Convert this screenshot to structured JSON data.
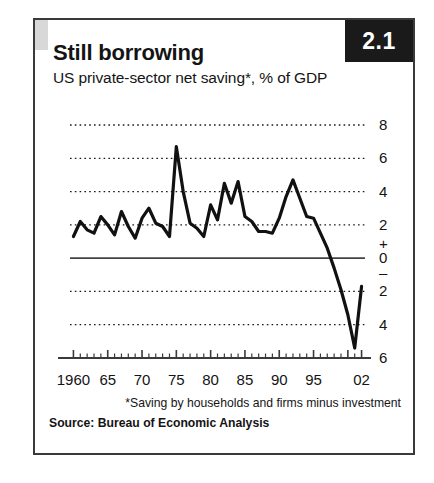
{
  "figure": {
    "badge_label": "2.1",
    "title": "Still borrowing",
    "subtitle": "US private-sector net saving*, % of GDP",
    "footnote": "*Saving by households and firms minus investment",
    "source": "Source: Bureau of Economic Analysis"
  },
  "chart_data": {
    "type": "line",
    "title": "Still borrowing",
    "subtitle": "US private-sector net saving*, % of GDP",
    "xlabel": "",
    "ylabel": "% of GDP",
    "xlim": [
      1959.5,
      2002.5
    ],
    "ylim": [
      -6,
      8
    ],
    "grid": true,
    "grid_style": "dotted",
    "legend": null,
    "zero_line": 0,
    "y_ticks": [
      8,
      6,
      4,
      2,
      0,
      -2,
      -4,
      -6
    ],
    "y_tick_labels": [
      "8",
      "6",
      "4",
      "2",
      "0",
      "2",
      "4",
      "6"
    ],
    "y_sign_markers": {
      "plus": "+",
      "minus": "–"
    },
    "x_ticks": [
      1960,
      1965,
      1970,
      1975,
      1980,
      1985,
      1990,
      1995,
      2002
    ],
    "x_tick_labels": [
      "1960",
      "65",
      "70",
      "75",
      "80",
      "85",
      "90",
      "95",
      "02"
    ],
    "x_minor_tick_interval": 1,
    "line_color": "#111111",
    "line_width": 3.2,
    "series": [
      {
        "name": "US private-sector net saving",
        "x": [
          1960,
          1961,
          1962,
          1963,
          1964,
          1965,
          1966,
          1967,
          1968,
          1969,
          1970,
          1971,
          1972,
          1973,
          1974,
          1975,
          1976,
          1977,
          1978,
          1979,
          1980,
          1981,
          1982,
          1983,
          1984,
          1985,
          1986,
          1987,
          1988,
          1989,
          1990,
          1991,
          1992,
          1993,
          1994,
          1995,
          1996,
          1997,
          1998,
          1999,
          2000,
          2001,
          2002
        ],
        "values": [
          1.3,
          2.2,
          1.7,
          1.5,
          2.5,
          2.0,
          1.4,
          2.8,
          1.9,
          1.2,
          2.4,
          3.0,
          2.1,
          1.9,
          1.3,
          6.7,
          4.0,
          2.1,
          1.8,
          1.3,
          3.2,
          2.3,
          4.5,
          3.3,
          4.6,
          2.5,
          2.2,
          1.6,
          1.6,
          1.5,
          2.4,
          3.7,
          4.7,
          3.6,
          2.5,
          2.4,
          1.5,
          0.6,
          -0.6,
          -1.9,
          -3.4,
          -5.4,
          -1.7
        ]
      }
    ]
  }
}
